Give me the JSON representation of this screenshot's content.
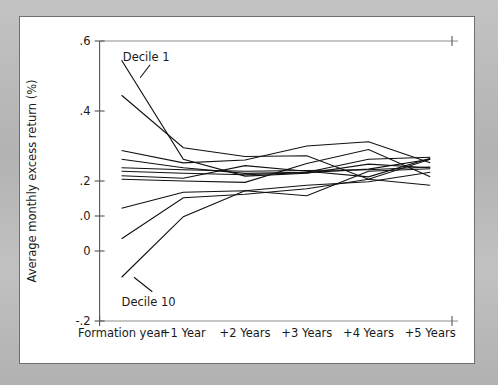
{
  "figure": {
    "panel_background": "#ffffff",
    "surround_background": "#bcbcbc",
    "line_color": "#111111",
    "axis_color": "#555555"
  },
  "annotations": {
    "top_series_label": "Decile 1",
    "bottom_series_label": "Decile 10"
  },
  "chart_data": {
    "type": "line",
    "title": "",
    "xlabel": "",
    "ylabel": "Average monthly excess return (%)",
    "categories": [
      "Formation year",
      "+1 Year",
      "+2 Years",
      "+3 Years",
      "+4 Years",
      "+5 Years"
    ],
    "x": [
      0,
      1,
      2,
      3,
      4,
      5
    ],
    "ytick_labels": [
      ".6",
      ".4",
      ".2",
      ".0",
      "0",
      "-.2"
    ],
    "ytick_values": [
      0.6,
      0.4,
      0.2,
      0.1,
      0.0,
      -0.2
    ],
    "ylim": [
      -0.2,
      0.6
    ],
    "xlim": [
      -0.35,
      5.45
    ],
    "grid": false,
    "legend": "none",
    "annotations": [
      {
        "text": "Decile 1",
        "x": 0.02,
        "y": 0.555,
        "points_to": [
          0.3,
          0.495
        ]
      },
      {
        "text": "Decile 10",
        "x": 0.0,
        "y": -0.145,
        "points_to": [
          0.2,
          -0.075
        ]
      }
    ],
    "series": [
      {
        "name": "Decile 1",
        "values": [
          0.545,
          0.262,
          0.214,
          0.222,
          0.248,
          0.238
        ]
      },
      {
        "name": "Decile 2",
        "values": [
          0.445,
          0.295,
          0.27,
          0.272,
          0.205,
          0.262
        ]
      },
      {
        "name": "Decile 3",
        "values": [
          0.287,
          0.252,
          0.26,
          0.3,
          0.312,
          0.252
        ]
      },
      {
        "name": "Decile 4",
        "values": [
          0.262,
          0.238,
          0.222,
          0.225,
          0.262,
          0.268
        ]
      },
      {
        "name": "Decile 5",
        "values": [
          0.238,
          0.232,
          0.228,
          0.23,
          0.232,
          0.24
        ]
      },
      {
        "name": "Decile 6",
        "values": [
          0.228,
          0.222,
          0.218,
          0.224,
          0.234,
          0.262
        ]
      },
      {
        "name": "Decile 7",
        "values": [
          0.215,
          0.208,
          0.244,
          0.228,
          0.212,
          0.265
        ]
      },
      {
        "name": "Decile 8",
        "values": [
          0.205,
          0.2,
          0.196,
          0.25,
          0.29,
          0.212
        ]
      },
      {
        "name": "Decile 9",
        "values": [
          0.122,
          0.168,
          0.172,
          0.158,
          0.228,
          0.235
        ]
      },
      {
        "name": "Decile 10",
        "values": [
          0.035,
          0.152,
          0.162,
          0.178,
          0.205,
          0.188
        ]
      },
      {
        "name": "Decile 10 lower",
        "values": [
          -0.075,
          0.098,
          0.172,
          0.188,
          0.198,
          0.225
        ]
      }
    ]
  }
}
